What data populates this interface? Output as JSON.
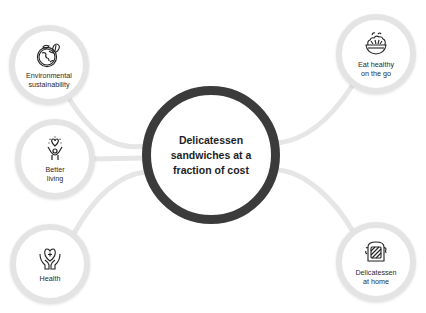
{
  "center": {
    "title_lines": [
      "Delicatessen",
      "sandwiches at a",
      "fraction of cost"
    ],
    "border_color": "#3b3b3b"
  },
  "nodes": [
    {
      "id": "environmental",
      "icon": "globe-leaf-icon",
      "lines": [
        "Environmental",
        "sustainability"
      ]
    },
    {
      "id": "better-living",
      "icon": "raised-hands-heart-icon",
      "lines": [
        "Better",
        "living"
      ]
    },
    {
      "id": "health",
      "icon": "hands-heart-cross-icon",
      "lines": [
        "Health"
      ]
    },
    {
      "id": "eat-healthy",
      "icon": "salad-bowl-icon",
      "lines": [
        "Eat healthy",
        "on the go"
      ]
    },
    {
      "id": "deli-home",
      "icon": "toasted-sandwich-icon",
      "lines": [
        "Delicatessen",
        "at home"
      ]
    }
  ],
  "colors": {
    "connector": "#e6e6e6",
    "node_ring": "#e4e4e4",
    "text": "#2b2b2b"
  }
}
